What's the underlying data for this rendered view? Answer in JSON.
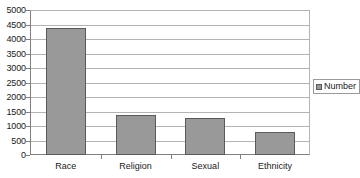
{
  "chart_data": {
    "type": "bar",
    "title": "",
    "subtitle": "",
    "xlabel": "",
    "ylabel": "",
    "categories": [
      "Race",
      "Religion",
      "Sexual",
      "Ethnicity"
    ],
    "series": [
      {
        "name": "Number",
        "values": [
          4370,
          1390,
          1280,
          780
        ],
        "color": "#999999"
      }
    ],
    "ylim": [
      0,
      5000
    ],
    "ytick_step": 500,
    "ytick_labels": [
      "5000",
      "4500",
      "4000",
      "3500",
      "3000",
      "2500",
      "2000",
      "1500",
      "1000",
      "500",
      "0"
    ],
    "grid": true,
    "grid_axis": "y",
    "legend": {
      "position": "right",
      "entries": [
        {
          "label": "Number",
          "marker": "legend-swatch-gray"
        }
      ]
    },
    "annotations": []
  },
  "colors": {
    "bar_fill": "#999999",
    "bar_outline": "#5a5a5a",
    "gridline": "#b4b4b4",
    "axis_line": "#808080",
    "text": "#1a1a1a",
    "background": "#ffffff",
    "legend_border": "#9a9a9a"
  }
}
